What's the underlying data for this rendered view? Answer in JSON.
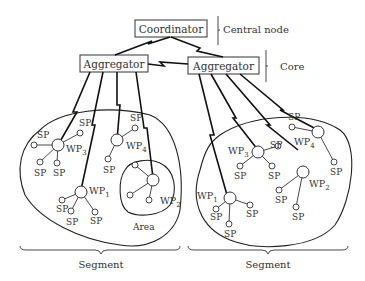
{
  "diagram": {
    "nodes": {
      "coordinator": "Coordinator",
      "aggregator_left": "Aggregator",
      "aggregator_right": "Aggregator"
    },
    "brackets": {
      "central_node": "Central node",
      "core": "Core",
      "segment_left": "Segment",
      "segment_right": "Segment"
    },
    "area_label": "Area",
    "sp": "SP",
    "wp": {
      "left": {
        "wp1": "WP",
        "wp1_sub": "1",
        "wp2": "WP",
        "wp2_sub": "2",
        "wp3": "WP",
        "wp3_sub": "3",
        "wp4": "WP",
        "wp4_sub": "4"
      },
      "right": {
        "wp1": "WP",
        "wp1_sub": "1",
        "wp2": "WP",
        "wp2_sub": "2",
        "wp3": "WP",
        "wp3_sub": "3",
        "wp4": "WP",
        "wp4_sub": "4"
      }
    }
  }
}
